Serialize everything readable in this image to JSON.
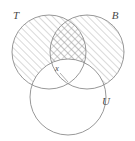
{
  "figure": {
    "type": "venn-diagram",
    "background_color": "#ffffff",
    "stroke_color": "#8c8c8c",
    "hatch_color": "#9a9a9a",
    "label_color": "#4a4a4a",
    "width": 135,
    "height": 141,
    "shaded_description": "Regions of T and B that lie outside U are hatched; T intersect B outside U is cross-hatched."
  },
  "sets": [
    {
      "id": "T",
      "label": "T",
      "cx": 49,
      "cy": 52,
      "r": 37,
      "shading": "diagonal-hatch",
      "label_x": 16,
      "label_y": 19
    },
    {
      "id": "B",
      "label": "B",
      "cx": 87,
      "cy": 52,
      "r": 37,
      "shading": "diagonal-hatch",
      "label_x": 115,
      "label_y": 19
    },
    {
      "id": "U",
      "label": "U",
      "cx": 68,
      "cy": 97,
      "r": 38,
      "shading": "none",
      "label_x": 106,
      "label_y": 105
    }
  ],
  "annotations": [
    {
      "id": "x",
      "label": "x",
      "label_x": 57,
      "label_y": 71,
      "leader_from_x": 60,
      "leader_from_y": 73,
      "leader_to_x": 68,
      "leader_to_y": 82
    }
  ]
}
